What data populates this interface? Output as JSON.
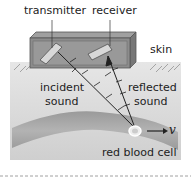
{
  "diagram": {
    "labels": {
      "transmitter": "transmitter",
      "receiver": "receiver",
      "skin": "skin",
      "incident_line1": "incident",
      "incident_line2": "sound",
      "reflected_line1": "reflected",
      "reflected_line2": "sound",
      "red_blood_cell": "red blood cell",
      "velocity": "v"
    },
    "colors": {
      "skin_tissue": "#d9d9d9",
      "box": "#8c8c8c",
      "vessel": "#a6a6a6",
      "text": "#222222"
    }
  }
}
